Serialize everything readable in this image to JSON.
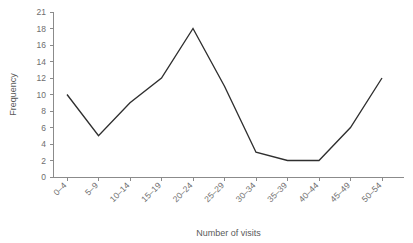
{
  "chart_data": {
    "type": "line",
    "title": "",
    "subtitle": "",
    "xlabel": "Number of visits",
    "ylabel": "Frequency",
    "categories": [
      "0–4",
      "5–9",
      "10–14",
      "15–19",
      "20–24",
      "25–29",
      "30–34",
      "35–39",
      "40–44",
      "45–49",
      "50–54"
    ],
    "values": [
      10,
      5,
      9,
      12,
      18,
      11,
      3,
      2,
      2,
      6,
      12
    ],
    "series": [
      {
        "name": "Frequency",
        "values": [
          10,
          5,
          9,
          12,
          18,
          11,
          3,
          2,
          2,
          6,
          12
        ]
      }
    ],
    "ytick_labels": [
      "0",
      "2",
      "4",
      "6",
      "8",
      "10",
      "12",
      "14",
      "16",
      "18",
      "21"
    ],
    "ytick_values": [
      0,
      2,
      4,
      6,
      8,
      10,
      12,
      14,
      16,
      18,
      21
    ],
    "ylim": [
      0,
      21
    ],
    "xlim_categories": 11,
    "grid": false,
    "legend": false,
    "legend_position": "none",
    "line_color": "#2f2f2f",
    "axis_color": "#8b8b8b",
    "text_color": "#6e6e6e",
    "background": "#ffffff",
    "xtick_label_rotation": 45
  },
  "axes": {
    "y_title": "Frequency",
    "x_title": "Number of visits"
  }
}
